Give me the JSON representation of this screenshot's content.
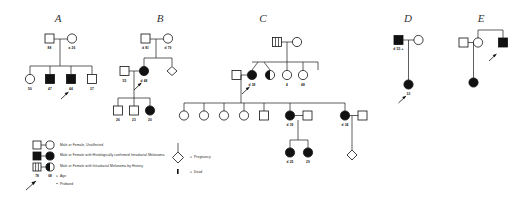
{
  "figure": {
    "kind": "pedigree-chart",
    "panels": [
      "A",
      "B",
      "C",
      "D",
      "E"
    ]
  },
  "titles": {
    "a": "A",
    "b": "B",
    "c": "C",
    "d": "D",
    "e": "E"
  },
  "legend": {
    "items": [
      {
        "symbol": "open-square-open-circle",
        "label": "Male or Female, Unaffected"
      },
      {
        "symbol": "filled-square-filled-circle",
        "label": "Male or Female with Histologically confirmed Intraductal Melanoma"
      },
      {
        "symbol": "striped-square-half-circle",
        "label": "Male or Female with Intraductal Melanoma by History"
      },
      {
        "symbol": "age-numbers",
        "label": "Age",
        "example_left": "78",
        "example_right": "68"
      },
      {
        "symbol": "arrow",
        "label": "Proband"
      },
      {
        "symbol": "diamond",
        "label": "Pregnancy"
      },
      {
        "symbol": "dot",
        "label": "Dead"
      }
    ]
  },
  "pedigree_a": {
    "gen1": [
      {
        "sex": "male",
        "status": "unaffected",
        "age": "88"
      },
      {
        "sex": "female",
        "status": "unaffected",
        "age": "a 26"
      }
    ],
    "gen2": [
      {
        "sex": "female",
        "status": "unaffected",
        "age": "50"
      },
      {
        "sex": "male",
        "status": "affected",
        "age": "47"
      },
      {
        "sex": "male",
        "status": "affected",
        "age": "44",
        "proband": true
      },
      {
        "sex": "male",
        "status": "unaffected",
        "age": "37"
      }
    ]
  },
  "pedigree_b": {
    "gen1": [
      {
        "sex": "male",
        "status": "unaffected",
        "age": "d 81"
      },
      {
        "sex": "female",
        "status": "unaffected",
        "age": "d 79"
      }
    ],
    "gen2": [
      {
        "sex": "male",
        "status": "unaffected",
        "age": "55"
      },
      {
        "sex": "female",
        "status": "affected",
        "age": "d 48",
        "proband": true
      },
      {
        "sex": "pregnancy",
        "status": "unaffected",
        "age": ""
      }
    ],
    "gen3": [
      {
        "sex": "male",
        "status": "unaffected",
        "age": "26"
      },
      {
        "sex": "male",
        "status": "unaffected",
        "age": "23"
      },
      {
        "sex": "female",
        "status": "affected",
        "age": "20"
      }
    ]
  },
  "pedigree_c": {
    "gen1": [
      {
        "sex": "male",
        "status": "by-history",
        "age": ""
      },
      {
        "sex": "female",
        "status": "unaffected",
        "age": ""
      }
    ],
    "gen2": [
      {
        "sex": "male",
        "status": "unaffected",
        "age": ""
      },
      {
        "sex": "female",
        "status": "affected",
        "age": "d 38",
        "proband": true
      },
      {
        "sex": "female",
        "status": "by-history",
        "age": ""
      },
      {
        "sex": "female",
        "status": "unaffected",
        "age": "4"
      },
      {
        "sex": "female",
        "status": "unaffected",
        "age": "48"
      }
    ],
    "gen3": [
      {
        "sex": "female",
        "status": "unaffected",
        "age": ""
      },
      {
        "sex": "female",
        "status": "unaffected",
        "age": ""
      },
      {
        "sex": "female",
        "status": "unaffected",
        "age": ""
      },
      {
        "sex": "female",
        "status": "unaffected",
        "age": ""
      },
      {
        "sex": "male",
        "status": "unaffected",
        "age": ""
      },
      {
        "sex": "female",
        "status": "affected",
        "age": "d 39"
      },
      {
        "sex": "male",
        "status": "unaffected",
        "age": ""
      },
      {
        "sex": "female",
        "status": "affected",
        "age": "d 34"
      }
    ],
    "gen4": [
      {
        "sex": "female",
        "status": "affected",
        "age": "d 25"
      },
      {
        "sex": "female",
        "status": "affected",
        "age": "29"
      },
      {
        "sex": "pregnancy",
        "status": "unaffected",
        "age": ""
      }
    ]
  },
  "pedigree_d": {
    "gen1": [
      {
        "sex": "male",
        "status": "affected",
        "age": "d 55 +"
      },
      {
        "sex": "female",
        "status": "unaffected",
        "age": ""
      }
    ],
    "gen2": [
      {
        "sex": "female",
        "status": "affected",
        "age": "32",
        "proband": true
      }
    ]
  },
  "pedigree_e": {
    "gen1": [
      {
        "sex": "male",
        "status": "unaffected",
        "age": ""
      },
      {
        "sex": "female",
        "status": "unaffected",
        "age": ""
      },
      {
        "sex": "male",
        "status": "affected",
        "age": "",
        "proband": true
      }
    ],
    "gen2": [
      {
        "sex": "female",
        "status": "affected",
        "age": ""
      }
    ]
  }
}
